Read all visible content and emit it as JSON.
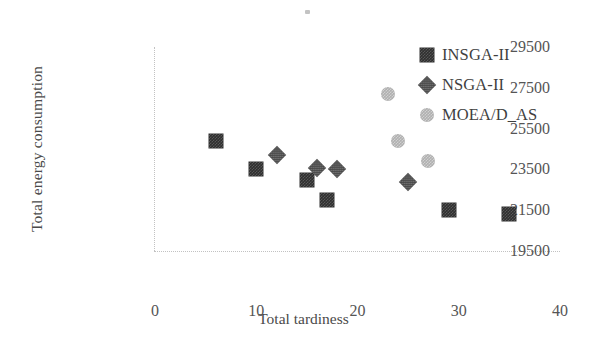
{
  "chart_data": {
    "type": "scatter",
    "title": "",
    "xlabel": "Total tardiness",
    "ylabel": "Total energy consumption",
    "xlim": [
      0,
      40
    ],
    "ylim": [
      19500,
      29500
    ],
    "xticks": [
      "0",
      "10",
      "20",
      "30",
      "40"
    ],
    "yticks": [
      "19500",
      "21500",
      "23500",
      "25500",
      "27500",
      "29500"
    ],
    "grid": false,
    "legend_position": "top-right",
    "series": [
      {
        "name": "INSGA-II",
        "marker": "square",
        "color": "#2f2f2f",
        "points": [
          {
            "x": 6,
            "y": 24900
          },
          {
            "x": 10,
            "y": 23500
          },
          {
            "x": 15,
            "y": 23000
          },
          {
            "x": 17,
            "y": 22000
          },
          {
            "x": 29,
            "y": 21500
          },
          {
            "x": 35,
            "y": 21300
          }
        ]
      },
      {
        "name": "NSGA-II",
        "marker": "diamond",
        "color": "#4a4a4a",
        "points": [
          {
            "x": 12,
            "y": 24200
          },
          {
            "x": 16,
            "y": 23550
          },
          {
            "x": 18,
            "y": 23500
          },
          {
            "x": 25,
            "y": 22900
          }
        ]
      },
      {
        "name": "MOEA/D_AS",
        "marker": "circle",
        "color": "#b0b0b0",
        "points": [
          {
            "x": 23,
            "y": 27200
          },
          {
            "x": 24,
            "y": 24900
          },
          {
            "x": 27,
            "y": 23900
          }
        ]
      }
    ]
  }
}
